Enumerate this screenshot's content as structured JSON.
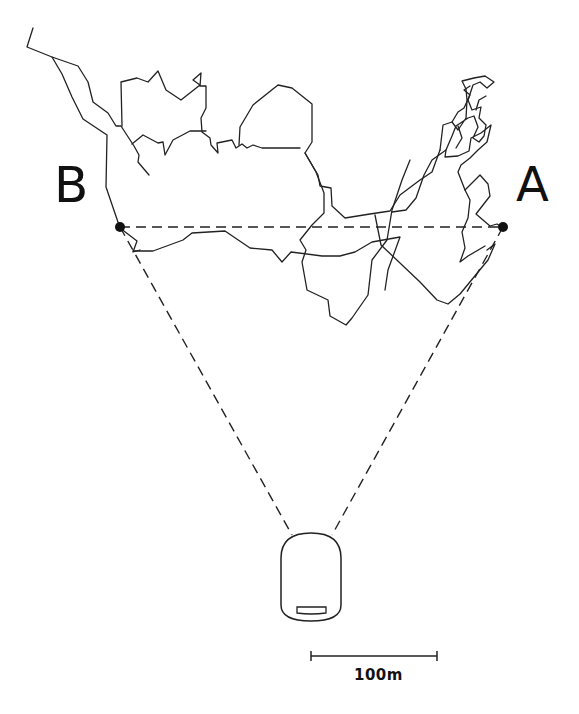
{
  "diagram": {
    "type": "random-walk trajectory diagram",
    "points": [
      {
        "id": "B",
        "label": "B"
      },
      {
        "id": "A",
        "label": "A"
      }
    ],
    "scale_bar": {
      "label": "100m"
    },
    "observer": {
      "description": "dome-shaped observation housing with slot"
    },
    "baseline": {
      "style": "dashed",
      "from": "B",
      "to": "A"
    },
    "sight_lines": [
      {
        "from": "observer",
        "to": "B",
        "style": "dashed"
      },
      {
        "from": "observer",
        "to": "A",
        "style": "dashed"
      }
    ],
    "colors": {
      "line": "#222222",
      "background": "#ffffff"
    }
  }
}
